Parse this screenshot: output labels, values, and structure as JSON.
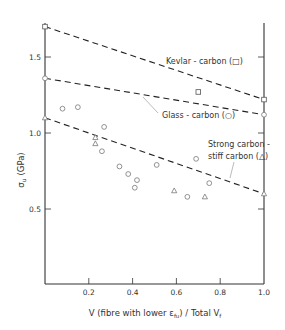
{
  "chart_data": {
    "type": "scatter",
    "title": "",
    "xlabel": "V (fibre with lower ε_fu) / Total V_f",
    "ylabel": "σ_u (GPa)",
    "xlim": [
      0,
      1.0
    ],
    "ylim": [
      0,
      1.75
    ],
    "x_ticks": [
      0.2,
      0.4,
      0.6,
      0.8,
      1.0
    ],
    "x_tick_labels": [
      "0.2",
      "0.4",
      "0.6",
      "0.8",
      "1.0"
    ],
    "y_ticks": [
      0.5,
      1.0,
      1.5
    ],
    "y_tick_labels": [
      "0.5",
      "1.0",
      "1.5"
    ],
    "grid": false,
    "lines": [
      {
        "name": "Kevlar-carbon (□)",
        "style": "dashed",
        "points": [
          [
            0,
            1.7
          ],
          [
            1.0,
            1.22
          ]
        ]
      },
      {
        "name": "Glass-carbon (○)",
        "style": "dashed",
        "points": [
          [
            0,
            1.36
          ],
          [
            1.0,
            1.12
          ]
        ]
      },
      {
        "name": "Strong carbon-stiff carbon (△)",
        "style": "dashed",
        "points": [
          [
            0,
            1.1
          ],
          [
            1.0,
            0.6
          ]
        ]
      }
    ],
    "series": [
      {
        "name": "Kevlar-carbon",
        "marker": "square",
        "points": [
          [
            0,
            1.7
          ],
          [
            0.7,
            1.27
          ],
          [
            1.0,
            1.22
          ]
        ]
      },
      {
        "name": "Glass-carbon",
        "marker": "circle",
        "points": [
          [
            0,
            1.36
          ],
          [
            0.08,
            1.16
          ],
          [
            0.15,
            1.17
          ],
          [
            0.27,
            1.04
          ],
          [
            0.26,
            0.88
          ],
          [
            0.34,
            0.78
          ],
          [
            0.38,
            0.73
          ],
          [
            0.42,
            0.69
          ],
          [
            0.41,
            0.64
          ],
          [
            0.51,
            0.79
          ],
          [
            0.69,
            0.83
          ],
          [
            0.75,
            0.67
          ],
          [
            0.65,
            0.58
          ],
          [
            1.0,
            1.12
          ]
        ]
      },
      {
        "name": "Strong carbon-stiff carbon",
        "marker": "triangle",
        "points": [
          [
            0,
            1.1
          ],
          [
            0.23,
            0.97
          ],
          [
            0.23,
            0.93
          ],
          [
            0.59,
            0.62
          ],
          [
            0.73,
            0.58
          ],
          [
            1.0,
            0.6
          ]
        ]
      }
    ],
    "annotations": [
      {
        "text": "Kevlar-carbon (□)",
        "x": 0.55,
        "y": 1.46
      },
      {
        "text": "Glass-carbon (○)",
        "x": 0.55,
        "y": 1.12
      },
      {
        "text": "Strong carbon-",
        "x": 0.74,
        "y": 0.92
      },
      {
        "text": "stiff carbon (△)",
        "x": 0.74,
        "y": 0.84
      }
    ]
  },
  "labels": {
    "y_axis": "σ",
    "y_axis_sub": "u",
    "y_axis_unit": "(GPa)",
    "x_axis_main": "V  (fibre  with  lower  ε",
    "x_axis_sub": "fu",
    "x_axis_end": ")  /  Total  V",
    "x_axis_end_sub": "f",
    "kevlar": "Kevlar - carbon  (□)",
    "glass": "Glass - carbon  (○)",
    "strong_1": "Strong  carbon -",
    "strong_2": "stiff  carbon  (△)"
  }
}
